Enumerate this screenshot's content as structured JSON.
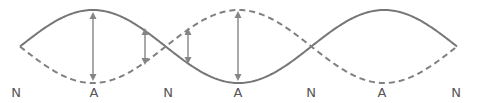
{
  "diagram": {
    "type": "standing-wave",
    "colors": {
      "solid_wave": "#777777",
      "dashed_wave": "#808080",
      "arrows": "#858585",
      "labels": "#555555"
    },
    "labels": [
      {
        "text": "N",
        "x": 16
      },
      {
        "text": "A",
        "x": 94
      },
      {
        "text": "N",
        "x": 168
      },
      {
        "text": "A",
        "x": 238
      },
      {
        "text": "N",
        "x": 311
      },
      {
        "text": "A",
        "x": 382
      },
      {
        "text": "N",
        "x": 456
      }
    ],
    "wave": {
      "x_start": 20,
      "x_end": 457,
      "center_y": 46.5,
      "amplitude": 36.5,
      "loops": 3
    },
    "arrows": [
      {
        "x": 93,
        "y1": 12,
        "y2": 81
      },
      {
        "x": 145,
        "y1": 28,
        "y2": 65
      },
      {
        "x": 188,
        "y1": 28,
        "y2": 64
      },
      {
        "x": 238,
        "y1": 11,
        "y2": 81
      }
    ]
  }
}
